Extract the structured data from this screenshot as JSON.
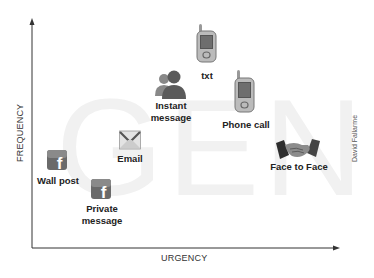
{
  "watermark": "GEN Y",
  "axes": {
    "x_label": "URGENCY",
    "y_label": "FREQUENCY",
    "color": "#333333"
  },
  "credit": "David Fallarme",
  "nodes": [
    {
      "id": "txt",
      "label": "txt",
      "icon": "mobile-phone-icon"
    },
    {
      "id": "instant-message",
      "label_line1": "Instant",
      "label_line2": "message",
      "icon": "users-icon"
    },
    {
      "id": "phone-call",
      "label": "Phone call",
      "icon": "mobile-phone-icon"
    },
    {
      "id": "email",
      "label": "Email",
      "icon": "envelope-icon"
    },
    {
      "id": "wall-post",
      "label": "Wall post",
      "icon": "facebook-icon"
    },
    {
      "id": "private-message",
      "label_line1": "Private",
      "label_line2": "message",
      "icon": "facebook-icon"
    },
    {
      "id": "face-to-face",
      "label": "Face to Face",
      "icon": "handshake-icon"
    }
  ],
  "colors": {
    "watermark": "#f1f1f1",
    "icon_dark": "#555555",
    "icon_mid": "#888888",
    "label": "#222222"
  }
}
